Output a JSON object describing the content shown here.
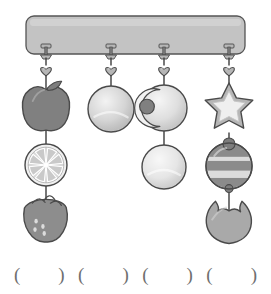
{
  "page": {
    "background_color": "#ffffff",
    "width": 271,
    "height": 294
  },
  "palette": {
    "outline": "#4a4a4a",
    "bar_fill": "#c3c3c3",
    "bar_stroke": "#555555",
    "string": "#3d3d3d",
    "charm_light": "#dcdcdc",
    "charm_mid": "#b6b6b6",
    "charm_dark": "#7d7d7d",
    "charm_darkest": "#6a6a6a",
    "highlight": "#efefef",
    "blank_text": "#6f6f6f"
  },
  "hanging_bar": {
    "name": "mounting rail",
    "x": 26,
    "y": 16,
    "width": 219,
    "height": 38,
    "radius": 8,
    "fill": "#c3c3c3",
    "stroke": "#555555"
  },
  "hooks": [
    {
      "label": "hook 1",
      "x": 46
    },
    {
      "label": "hook 2",
      "x": 111
    },
    {
      "label": "hook 3",
      "x": 164
    },
    {
      "label": "hook 4",
      "x": 229
    }
  ],
  "strands": [
    {
      "id": "strand-1",
      "label": "Strand 1",
      "x": 46,
      "charm_count": 3,
      "heart": {
        "y": 70
      },
      "charms": [
        {
          "type": "apple",
          "label": "apple",
          "cy": 108,
          "r": 23,
          "fill": "#808080"
        },
        {
          "type": "citrus-slice",
          "label": "orange slice",
          "cy": 165,
          "r": 21,
          "fill": "#d8d8d8",
          "segments": 8
        },
        {
          "type": "strawberry",
          "label": "strawberry",
          "cy": 219,
          "r": 22,
          "fill": "#8d8d8d"
        }
      ]
    },
    {
      "id": "strand-2",
      "label": "Strand 2",
      "x": 111,
      "charm_count": 1,
      "heart": {
        "y": 70
      },
      "charms": [
        {
          "type": "ball",
          "label": "plain ball",
          "cy": 109,
          "r": 23,
          "fill": "#cfcfcf"
        }
      ]
    },
    {
      "id": "strand-3",
      "label": "Strand 3",
      "x": 164,
      "charm_count": 2,
      "heart": {
        "y": 70
      },
      "charms": [
        {
          "type": "crescent-ball",
          "label": "bitten ball with bead",
          "cy": 108,
          "r": 23,
          "fill": "#dadada",
          "bead_fill": "#808080"
        },
        {
          "type": "ball",
          "label": "plain ball",
          "cy": 167,
          "r": 22,
          "fill": "#e2e2e2"
        }
      ]
    },
    {
      "id": "strand-4",
      "label": "Strand 4",
      "x": 229,
      "charm_count": 3,
      "heart": {
        "y": 70
      },
      "charms": [
        {
          "type": "star",
          "label": "star",
          "cy": 108,
          "r": 25,
          "fill": "#dcdcdc"
        },
        {
          "type": "striped-top",
          "label": "striped spinning top bead",
          "cy": 166,
          "r": 23,
          "fill": "#dcdcdc",
          "band_fill": "#8b8b8b"
        },
        {
          "type": "shell",
          "label": "shell pouch",
          "cy": 220,
          "r": 24,
          "fill": "#a9a9a9"
        }
      ]
    }
  ],
  "answer_blanks": {
    "y": 265,
    "label": "answer blanks",
    "items": [
      {
        "id": "blank-1",
        "text": "(        )"
      },
      {
        "id": "blank-2",
        "text": "(        )"
      },
      {
        "id": "blank-3",
        "text": "(        )"
      },
      {
        "id": "blank-4",
        "text": "(        )"
      }
    ]
  }
}
